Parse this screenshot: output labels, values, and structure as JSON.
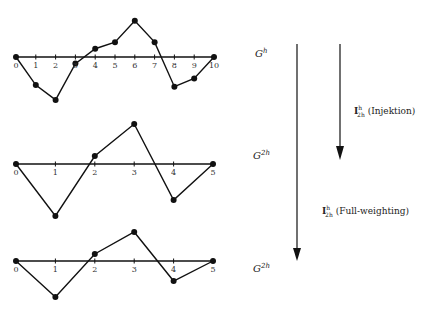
{
  "chart_data": [
    {
      "type": "line",
      "title": "Fine grid function on G^h",
      "x": [
        0,
        1,
        2,
        3,
        4,
        5,
        6,
        7,
        8,
        9,
        10
      ],
      "values": [
        0,
        -1.7,
        -2.6,
        -0.4,
        0.5,
        0.9,
        2.2,
        0.9,
        -1.8,
        -1.3,
        0
      ],
      "tick_labels": [
        "0",
        "1",
        "2",
        "3",
        "4",
        "5",
        "6",
        "7",
        "8",
        "9",
        "10"
      ]
    },
    {
      "type": "line",
      "title": "Restriction by injection on G^2h",
      "x": [
        0,
        1,
        2,
        3,
        4,
        5
      ],
      "values": [
        0,
        -2.6,
        0.4,
        2.0,
        -1.8,
        0
      ],
      "tick_labels": [
        "0",
        "1",
        "2",
        "3",
        "4",
        "5"
      ]
    },
    {
      "type": "line",
      "title": "Restriction by full-weighting on G^2h",
      "x": [
        0,
        1,
        2,
        3,
        4,
        5
      ],
      "values": [
        0,
        -1.8,
        0.35,
        1.45,
        -1.0,
        0
      ],
      "tick_labels": [
        "0",
        "1",
        "2",
        "3",
        "4",
        "5"
      ]
    }
  ],
  "labels": {
    "grid_fine": "G",
    "grid_fine_sup": "h",
    "grid_coarse": "G",
    "grid_coarse_sup": "2h",
    "op_symbol": "I",
    "op_sup": "h",
    "op_sub": "2h",
    "injection": "(Injektion)",
    "full_weighting": "(Full-weighting)"
  }
}
